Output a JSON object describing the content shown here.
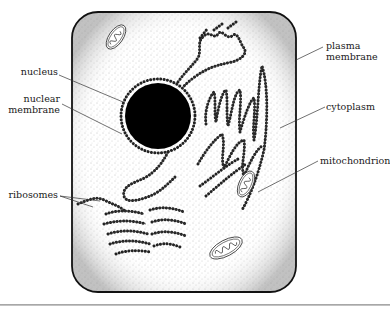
{
  "figure": {
    "type": "cell-diagram",
    "title": "",
    "colors": {
      "outline": "#111111",
      "cytoplasm_stipple": "#9a9a9a",
      "nucleus_fill": "#000000",
      "background": "#ffffff"
    }
  },
  "labels": {
    "nucleus": "nucleus",
    "nuclear_membrane": "nuclear\nmembrane",
    "ribosomes": "ribosomes",
    "plasma_membrane": "plasma\nmembrane",
    "cytoplasm": "cytoplasm",
    "mitochondrion": "mitochondrion"
  }
}
